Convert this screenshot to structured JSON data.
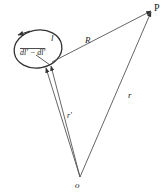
{
  "diagram": {
    "title": "",
    "colors": {
      "stroke": "#333333",
      "text": "#222222",
      "background": "#ffffff"
    },
    "labels": {
      "point_p": "P",
      "origin": "o",
      "vector_R": "R",
      "vector_r": "r",
      "vector_r_prime": "r′",
      "loop": "l",
      "loop_element": "dl′ − dl′"
    },
    "nodes": [
      {
        "id": "P",
        "label": "P",
        "x": 152,
        "y": 10
      },
      {
        "id": "o",
        "label": "o",
        "x": 80,
        "y": 178
      },
      {
        "id": "loop",
        "label": "l",
        "shape": "ellipse",
        "cx": 38,
        "cy": 49,
        "rx": 24,
        "ry": 19
      }
    ],
    "edges": [
      {
        "from": "o",
        "to": "P",
        "label": "r",
        "arrow": true
      },
      {
        "from": "loop_point",
        "to": "P",
        "label": "R",
        "arrow": true
      },
      {
        "from": "o",
        "to": "loop_point_a",
        "label": "r′",
        "arrow": true
      },
      {
        "from": "o",
        "to": "loop_point_b",
        "label": "",
        "arrow": true
      }
    ]
  }
}
